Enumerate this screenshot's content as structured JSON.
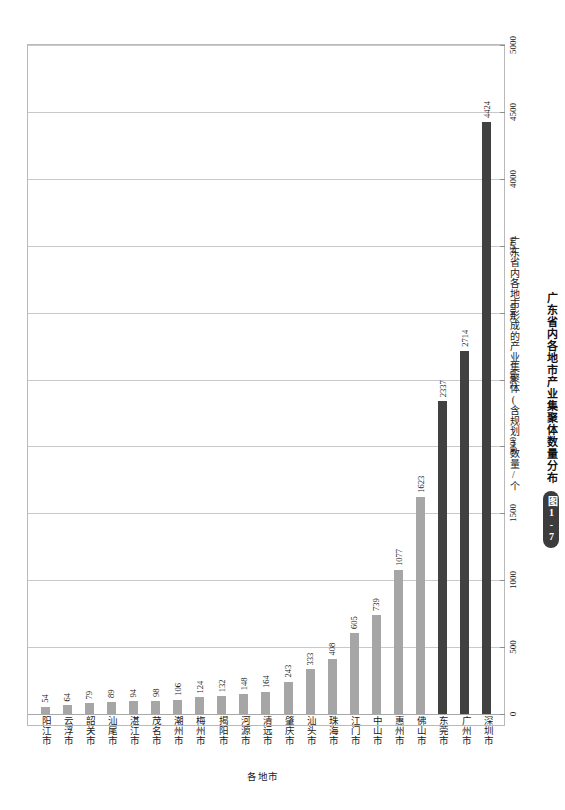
{
  "chart_data": {
    "type": "bar",
    "title": "广东省内各地市产业集聚体数量分布",
    "figure_number": "图1-7",
    "xlabel": "各地市",
    "ylabel": "广东省内各地市形成的产业集聚体(含规划)数量/个",
    "ylim": [
      0,
      5000
    ],
    "ytick_values": [
      0,
      500,
      1000,
      1500,
      2000,
      2500,
      3000,
      3500,
      4000,
      4500,
      5000
    ],
    "ytick_labels": [
      "0",
      "500",
      "1000",
      "1500",
      "2000",
      "2500",
      "3000",
      "3500",
      "4000",
      "4500",
      "5000"
    ],
    "grid": true,
    "legend": null,
    "categories": [
      "阳江市",
      "云浮市",
      "韶关市",
      "汕尾市",
      "湛江市",
      "茂名市",
      "潮州市",
      "梅州市",
      "揭阳市",
      "河源市",
      "清远市",
      "肇庆市",
      "汕头市",
      "珠海市",
      "江门市",
      "中山市",
      "惠州市",
      "佛山市",
      "东莞市",
      "广州市",
      "深圳市"
    ],
    "values": [
      54,
      64,
      79,
      89,
      94,
      98,
      106,
      124,
      132,
      148,
      164,
      243,
      333,
      408,
      605,
      739,
      1077,
      1623,
      2337,
      2714,
      4424
    ],
    "bar_colors": [
      "#a6a6a6",
      "#a6a6a6",
      "#a6a6a6",
      "#a6a6a6",
      "#a6a6a6",
      "#a6a6a6",
      "#a6a6a6",
      "#a6a6a6",
      "#a6a6a6",
      "#a6a6a6",
      "#a6a6a6",
      "#a6a6a6",
      "#a6a6a6",
      "#a6a6a6",
      "#a6a6a6",
      "#a6a6a6",
      "#a6a6a6",
      "#a6a6a6",
      "#414141",
      "#414141",
      "#414141"
    ],
    "accent_light": "#a6a6a6",
    "accent_dark": "#414141",
    "gridline_color": "#c9c9c9",
    "frame_color": "#b9b9b9"
  }
}
